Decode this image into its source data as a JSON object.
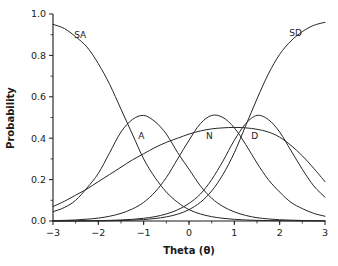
{
  "chart_data": {
    "type": "line",
    "title": "",
    "xlabel": "Theta (θ)",
    "ylabel": "Probability",
    "xlim": [
      -3,
      3
    ],
    "ylim": [
      0.0,
      1.0
    ],
    "grid": false,
    "legend_position": "inline-curve-labels",
    "xticks": [
      "-3",
      "-2",
      "-1",
      "0",
      "1",
      "2",
      "3"
    ],
    "xtick_values": [
      -3,
      -2,
      -1,
      0,
      1,
      2,
      3
    ],
    "yticks": [
      "0.0",
      "0.2",
      "0.4",
      "0.6",
      "0.8",
      "1.0"
    ],
    "ytick_values": [
      0.0,
      0.2,
      0.4,
      0.6,
      0.8,
      1.0
    ],
    "x": [
      -3.0,
      -2.75,
      -2.5,
      -2.25,
      -2.0,
      -1.75,
      -1.5,
      -1.25,
      -1.0,
      -0.75,
      -0.5,
      -0.25,
      0.0,
      0.25,
      0.5,
      0.75,
      1.0,
      1.25,
      1.5,
      1.75,
      2.0,
      2.25,
      2.5,
      2.75,
      3.0
    ],
    "series": [
      {
        "name": "SA",
        "label": "SA",
        "label_at": {
          "x": -2.4,
          "y": 0.9
        },
        "peak": {
          "x": -3.0,
          "y": 0.95
        },
        "values": [
          0.95,
          0.93,
          0.89,
          0.84,
          0.76,
          0.66,
          0.54,
          0.42,
          0.3,
          0.21,
          0.14,
          0.09,
          0.055,
          0.034,
          0.021,
          0.013,
          0.008,
          0.005,
          0.003,
          0.002,
          0.0013,
          0.0008,
          0.0005,
          0.0003,
          0.0002
        ]
      },
      {
        "name": "A",
        "label": "A",
        "label_at": {
          "x": -1.05,
          "y": 0.41
        },
        "peak": {
          "x": -1.0,
          "y": 0.51
        },
        "values": [
          0.045,
          0.065,
          0.1,
          0.16,
          0.23,
          0.33,
          0.43,
          0.49,
          0.51,
          0.48,
          0.42,
          0.33,
          0.25,
          0.17,
          0.11,
          0.07,
          0.044,
          0.027,
          0.016,
          0.01,
          0.006,
          0.004,
          0.0025,
          0.0015,
          0.001
        ]
      },
      {
        "name": "N",
        "label": "N",
        "label_at": {
          "x": 0.45,
          "y": 0.41
        },
        "peak": {
          "x": 0.5,
          "y": 0.51
        },
        "values": [
          0.002,
          0.003,
          0.005,
          0.009,
          0.014,
          0.023,
          0.037,
          0.058,
          0.09,
          0.14,
          0.21,
          0.3,
          0.39,
          0.47,
          0.51,
          0.5,
          0.45,
          0.37,
          0.28,
          0.2,
          0.14,
          0.09,
          0.06,
          0.037,
          0.023
        ]
      },
      {
        "name": "D",
        "label": "D",
        "label_at": {
          "x": 1.45,
          "y": 0.41
        },
        "peak": {
          "x": 1.5,
          "y": 0.51
        },
        "values": [
          0.0002,
          0.0004,
          0.0006,
          0.001,
          0.002,
          0.003,
          0.005,
          0.008,
          0.013,
          0.021,
          0.034,
          0.054,
          0.085,
          0.13,
          0.2,
          0.29,
          0.39,
          0.47,
          0.51,
          0.49,
          0.43,
          0.34,
          0.25,
          0.17,
          0.115
        ]
      },
      {
        "name": "SD",
        "label": "SD",
        "label_at": {
          "x": 2.35,
          "y": 0.91
        },
        "peak": {
          "x": 3.0,
          "y": 0.96
        },
        "values": [
          0.0001,
          0.0002,
          0.0003,
          0.0005,
          0.0008,
          0.0014,
          0.0024,
          0.004,
          0.007,
          0.012,
          0.02,
          0.033,
          0.055,
          0.09,
          0.145,
          0.225,
          0.33,
          0.46,
          0.59,
          0.71,
          0.805,
          0.87,
          0.915,
          0.945,
          0.96
        ]
      },
      {
        "name": "broad",
        "label": "",
        "label_at": {
          "x": 2.0,
          "y": 0.45
        },
        "peak": {
          "x": 1.9,
          "y": 0.45
        },
        "values": [
          0.07,
          0.095,
          0.125,
          0.155,
          0.19,
          0.225,
          0.26,
          0.295,
          0.325,
          0.355,
          0.38,
          0.4,
          0.42,
          0.435,
          0.445,
          0.45,
          0.452,
          0.45,
          0.443,
          0.43,
          0.405,
          0.365,
          0.315,
          0.255,
          0.19
        ]
      }
    ]
  }
}
